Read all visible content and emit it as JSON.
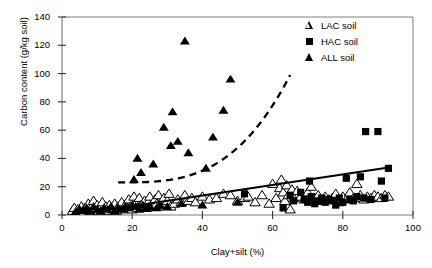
{
  "chart_data": {
    "type": "scatter",
    "title": "",
    "xlabel": "Clay+silt (%)",
    "ylabel": "Carbon content (g/kg soil)",
    "xlim": [
      0,
      100
    ],
    "ylim": [
      0,
      140
    ],
    "xticks": [
      0,
      20,
      40,
      60,
      80,
      100
    ],
    "yticks": [
      0,
      20,
      40,
      60,
      80,
      100,
      120,
      140
    ],
    "grid": false,
    "legend_position": "top-right",
    "legend": [
      {
        "label": "LAC soil",
        "marker": "open-triangle"
      },
      {
        "label": "HAC soil",
        "marker": "filled-square"
      },
      {
        "label": "ALL soil",
        "marker": "filled-triangle"
      }
    ],
    "series": [
      {
        "name": "LAC soil",
        "marker": "open-triangle",
        "points": [
          [
            3,
            3
          ],
          [
            3.5,
            5
          ],
          [
            4,
            2
          ],
          [
            4.5,
            4
          ],
          [
            5,
            3
          ],
          [
            5.5,
            6
          ],
          [
            6,
            2
          ],
          [
            6.5,
            5
          ],
          [
            7,
            4
          ],
          [
            7.5,
            8
          ],
          [
            8,
            3
          ],
          [
            8.5,
            6
          ],
          [
            9,
            10
          ],
          [
            9.5,
            4
          ],
          [
            10,
            7
          ],
          [
            10.5,
            3
          ],
          [
            11,
            5
          ],
          [
            11.5,
            9
          ],
          [
            12,
            4
          ],
          [
            12.5,
            6
          ],
          [
            13,
            3
          ],
          [
            13.5,
            7
          ],
          [
            14,
            5
          ],
          [
            14.5,
            4
          ],
          [
            15,
            8
          ],
          [
            15.5,
            3
          ],
          [
            16,
            6
          ],
          [
            16.5,
            5
          ],
          [
            17,
            9
          ],
          [
            17.5,
            4
          ],
          [
            18,
            7
          ],
          [
            18.5,
            5
          ],
          [
            19,
            11
          ],
          [
            19.5,
            6
          ],
          [
            20,
            4
          ],
          [
            20.5,
            13
          ],
          [
            21,
            8
          ],
          [
            21.5,
            5
          ],
          [
            22,
            12
          ],
          [
            22.5,
            7
          ],
          [
            23,
            6
          ],
          [
            23.5,
            10
          ],
          [
            24,
            5
          ],
          [
            24.5,
            9
          ],
          [
            25,
            13
          ],
          [
            25.5,
            7
          ],
          [
            26,
            6
          ],
          [
            26.5,
            11
          ],
          [
            27,
            8
          ],
          [
            27.5,
            14
          ],
          [
            28,
            6
          ],
          [
            28.5,
            9
          ],
          [
            29,
            12
          ],
          [
            29.5,
            7
          ],
          [
            30,
            10
          ],
          [
            30.5,
            15
          ],
          [
            31,
            6
          ],
          [
            32,
            8
          ],
          [
            33,
            11
          ],
          [
            34,
            9
          ],
          [
            35,
            14
          ],
          [
            36,
            10
          ],
          [
            37,
            12
          ],
          [
            38,
            9
          ],
          [
            40,
            13
          ],
          [
            42,
            11
          ],
          [
            44,
            12
          ],
          [
            46,
            15
          ],
          [
            48,
            14
          ],
          [
            50,
            10
          ],
          [
            52,
            12
          ],
          [
            53,
            13
          ],
          [
            55,
            9
          ],
          [
            57,
            14
          ],
          [
            59,
            8
          ],
          [
            60,
            22
          ],
          [
            61,
            12
          ],
          [
            62,
            19
          ],
          [
            62.5,
            25
          ],
          [
            63,
            16
          ],
          [
            63.5,
            10
          ],
          [
            64,
            21
          ],
          [
            64.5,
            14
          ],
          [
            65,
            4
          ],
          [
            65.5,
            18
          ],
          [
            66,
            12
          ],
          [
            67,
            17
          ],
          [
            68,
            13
          ],
          [
            69,
            11
          ],
          [
            70,
            16
          ],
          [
            71,
            20
          ],
          [
            72,
            12
          ],
          [
            73,
            14
          ],
          [
            74,
            10
          ],
          [
            75,
            13
          ],
          [
            76,
            11
          ],
          [
            77,
            12
          ],
          [
            78,
            15
          ],
          [
            79,
            9
          ],
          [
            80,
            13
          ],
          [
            81,
            11
          ],
          [
            82,
            16
          ],
          [
            83,
            12
          ],
          [
            84,
            22
          ],
          [
            85,
            14
          ],
          [
            86,
            11
          ],
          [
            87,
            13
          ],
          [
            88,
            12
          ],
          [
            89,
            14
          ],
          [
            90,
            13
          ],
          [
            91,
            12
          ],
          [
            92,
            14
          ],
          [
            93,
            13
          ]
        ]
      },
      {
        "name": "HAC soil",
        "marker": "filled-square",
        "points": [
          [
            52,
            15
          ],
          [
            63,
            5
          ],
          [
            65,
            14
          ],
          [
            66,
            10
          ],
          [
            68,
            16
          ],
          [
            69,
            11
          ],
          [
            70,
            9
          ],
          [
            70.5,
            24
          ],
          [
            71,
            13
          ],
          [
            72,
            8
          ],
          [
            73,
            10
          ],
          [
            74,
            12
          ],
          [
            75,
            9
          ],
          [
            76,
            11
          ],
          [
            77,
            10
          ],
          [
            78,
            7
          ],
          [
            79,
            12
          ],
          [
            80,
            9
          ],
          [
            81,
            26
          ],
          [
            82,
            11
          ],
          [
            83,
            10
          ],
          [
            84,
            13
          ],
          [
            85,
            27
          ],
          [
            86,
            12
          ],
          [
            86.5,
            59
          ],
          [
            88,
            11
          ],
          [
            90,
            59
          ],
          [
            91,
            24
          ],
          [
            92,
            12
          ],
          [
            93,
            33
          ]
        ]
      },
      {
        "name": "ALL soil",
        "marker": "filled-triangle",
        "points": [
          [
            4,
            2
          ],
          [
            5,
            4
          ],
          [
            6,
            3
          ],
          [
            7,
            5
          ],
          [
            8,
            3
          ],
          [
            9,
            6
          ],
          [
            10,
            4
          ],
          [
            11,
            3
          ],
          [
            12,
            5
          ],
          [
            13,
            4
          ],
          [
            14,
            6
          ],
          [
            15,
            3
          ],
          [
            16,
            5
          ],
          [
            17,
            4
          ],
          [
            18,
            6
          ],
          [
            19,
            5
          ],
          [
            20,
            7
          ],
          [
            20.5,
            25
          ],
          [
            21,
            6
          ],
          [
            21.5,
            40
          ],
          [
            22,
            4
          ],
          [
            22.5,
            30
          ],
          [
            23,
            7
          ],
          [
            24,
            5
          ],
          [
            25,
            6
          ],
          [
            26,
            36
          ],
          [
            27,
            5
          ],
          [
            28,
            7
          ],
          [
            29,
            62
          ],
          [
            30,
            6
          ],
          [
            31,
            49
          ],
          [
            31.5,
            73
          ],
          [
            33,
            52
          ],
          [
            34,
            8
          ],
          [
            35,
            123
          ],
          [
            36,
            44
          ],
          [
            40,
            7
          ],
          [
            41,
            33
          ],
          [
            43,
            55
          ],
          [
            46,
            74
          ],
          [
            48,
            96
          ],
          [
            50,
            9
          ]
        ]
      }
    ],
    "fit_lines": [
      {
        "name": "LAC/HAC regression (solid)",
        "style": "solid",
        "x_start": 6,
        "y_start": 1,
        "x_end": 94,
        "y_end": 34
      },
      {
        "name": "ALL soil trend (dashed)",
        "style": "dashed",
        "x_start": 16,
        "y_start": 23,
        "x_end": 65,
        "y_end": 99,
        "shape": "exponential"
      }
    ]
  }
}
